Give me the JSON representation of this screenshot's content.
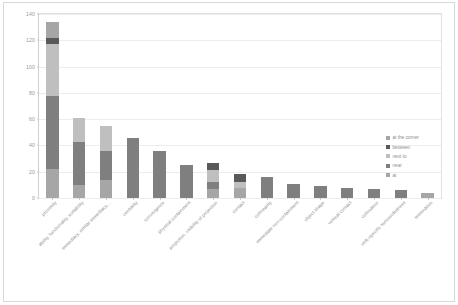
{
  "chart_data": {
    "type": "bar",
    "stacked": true,
    "title": "",
    "xlabel": "",
    "ylabel": "",
    "ylim": [
      0,
      140
    ],
    "yticks": [
      0,
      20,
      40,
      60,
      80,
      100,
      120,
      140
    ],
    "grid": true,
    "legend_position": "right",
    "categories": [
      "proximity",
      "ability, functionality, sortability",
      "immediacy, similar immediacy,...",
      "centrality",
      "convergence",
      "physical containment",
      "projection, visibility of projection",
      "contact",
      "collinearity",
      "immediate non-containment",
      "object shape",
      "vertical contact",
      "collocation",
      "verb-specific surroundedness",
      "termination"
    ],
    "series": [
      {
        "name": "at",
        "color": "#a6a6a6",
        "values": [
          22,
          10,
          14,
          0,
          0,
          0,
          7,
          8,
          0,
          0,
          0,
          0,
          0,
          0,
          4
        ]
      },
      {
        "name": "near",
        "color": "#7f7f7f",
        "values": [
          56,
          33,
          22,
          46,
          36,
          25,
          5,
          0,
          16,
          11,
          9,
          8,
          7,
          6,
          0
        ]
      },
      {
        "name": "next to",
        "color": "#bfbfbf",
        "values": [
          39,
          18,
          19,
          0,
          0,
          0,
          9,
          4,
          0,
          0,
          0,
          0,
          0,
          0,
          0
        ]
      },
      {
        "name": "between",
        "color": "#595959",
        "values": [
          5,
          0,
          0,
          0,
          0,
          0,
          6,
          6,
          0,
          0,
          0,
          0,
          0,
          0,
          0
        ]
      },
      {
        "name": "at the corner",
        "color": "#a6a6a6",
        "values": [
          12,
          0,
          0,
          0,
          0,
          0,
          0,
          0,
          0,
          0,
          0,
          0,
          0,
          0,
          0
        ]
      }
    ],
    "totals": [
      134,
      61,
      55,
      46,
      36,
      25,
      27,
      18,
      16,
      11,
      9,
      8,
      7,
      6,
      4
    ]
  },
  "legend": {
    "items": [
      {
        "label": "at the corner",
        "color": "#a6a6a6"
      },
      {
        "label": "between",
        "color": "#595959"
      },
      {
        "label": "next to",
        "color": "#bfbfbf"
      },
      {
        "label": "near",
        "color": "#7f7f7f"
      },
      {
        "label": "at",
        "color": "#a6a6a6"
      }
    ]
  }
}
